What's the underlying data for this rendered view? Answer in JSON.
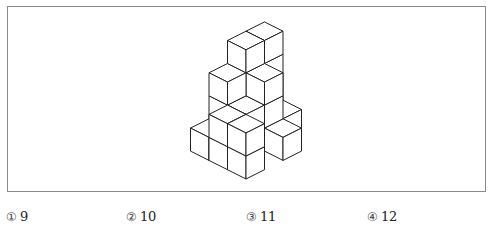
{
  "question": {
    "figure": {
      "description": "stacked-unit-cubes",
      "stroke_color": "#222222",
      "face_color": "#ffffff",
      "cubes": [
        {
          "a": -2,
          "b": -3,
          "z": 0
        },
        {
          "a": -2,
          "b": -2,
          "z": 0
        },
        {
          "a": -1,
          "b": -3,
          "z": 0
        },
        {
          "a": -1,
          "b": -2,
          "z": 0
        },
        {
          "a": -2,
          "b": -1,
          "z": 0
        },
        {
          "a": -1,
          "b": -1,
          "z": 0
        },
        {
          "a": 0,
          "b": -2,
          "z": 0
        },
        {
          "a": -2,
          "b": 0,
          "z": 0
        },
        {
          "a": -1,
          "b": 0,
          "z": 0
        },
        {
          "a": 0,
          "b": 0,
          "z": 0
        },
        {
          "a": -2,
          "b": -3,
          "z": 1
        },
        {
          "a": -2,
          "b": -2,
          "z": 1
        },
        {
          "a": -1,
          "b": -2,
          "z": 1
        },
        {
          "a": -2,
          "b": -1,
          "z": 1
        },
        {
          "a": -1,
          "b": -1,
          "z": 1
        },
        {
          "a": -1,
          "b": 0,
          "z": 1
        },
        {
          "a": 0,
          "b": 0,
          "z": 1
        },
        {
          "a": -2,
          "b": -3,
          "z": 2
        },
        {
          "a": -2,
          "b": -2,
          "z": 2
        },
        {
          "a": -1,
          "b": -2,
          "z": 2
        },
        {
          "a": -2,
          "b": -1,
          "z": 2
        },
        {
          "a": -2,
          "b": -2,
          "z": 3
        },
        {
          "a": -2,
          "b": -3,
          "z": 3
        }
      ]
    },
    "options": [
      {
        "marker": "①",
        "value": "9"
      },
      {
        "marker": "②",
        "value": "10"
      },
      {
        "marker": "③",
        "value": "11"
      },
      {
        "marker": "④",
        "value": "12"
      }
    ]
  }
}
